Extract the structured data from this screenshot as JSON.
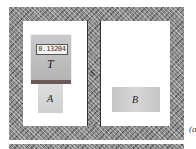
{
  "diagram": {
    "thermometer": {
      "label": "T",
      "reading": "0.13204"
    },
    "separator": {
      "label": "S"
    },
    "block_a": {
      "label": "A"
    },
    "block_b": {
      "label": "B"
    },
    "caption": "(a"
  },
  "colors": {
    "insulation": "#8a8a8a",
    "interior": "#ffffff",
    "thermometer_body": "#c0c0c0",
    "thermometer_strip": "#6a5a5a",
    "block_a": "#d6d6d6",
    "block_b": "#cccccc"
  }
}
